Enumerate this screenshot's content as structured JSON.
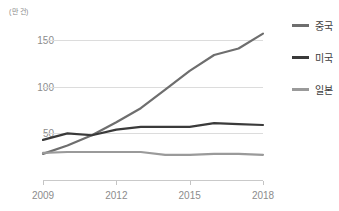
{
  "chart_data": {
    "type": "line",
    "title": "",
    "unit_label": "(만 건)",
    "xlabel": "",
    "ylabel": "",
    "x": [
      2009,
      2010,
      2011,
      2012,
      2013,
      2014,
      2015,
      2016,
      2017,
      2018
    ],
    "xtick_labels": [
      "2009",
      "2012",
      "2015",
      "2018"
    ],
    "xtick_values": [
      2009,
      2012,
      2015,
      2018
    ],
    "ytick_labels": [
      "50",
      "100",
      "150"
    ],
    "ytick_values": [
      50,
      100,
      150
    ],
    "xlim": [
      2009,
      2018
    ],
    "ylim": [
      0,
      163
    ],
    "grid": true,
    "legend_position": "right",
    "series": [
      {
        "name": "중국",
        "color": "#6e6e6e",
        "values": [
          28,
          37,
          48,
          62,
          77,
          97,
          117,
          134,
          141,
          157
        ]
      },
      {
        "name": "미국",
        "color": "#3a3a3a",
        "values": [
          43,
          50,
          48,
          54,
          57,
          57,
          57,
          61,
          60,
          59
        ]
      },
      {
        "name": "일본",
        "color": "#9a9a9a",
        "values": [
          29,
          30,
          30,
          30,
          30,
          27,
          27,
          28,
          28,
          27
        ]
      }
    ]
  },
  "legend": {
    "items": [
      {
        "label": "중국",
        "color": "#6e6e6e"
      },
      {
        "label": "미국",
        "color": "#3a3a3a"
      },
      {
        "label": "일본",
        "color": "#9a9a9a"
      }
    ]
  },
  "axes": {
    "unit_label": "(만 건)"
  }
}
